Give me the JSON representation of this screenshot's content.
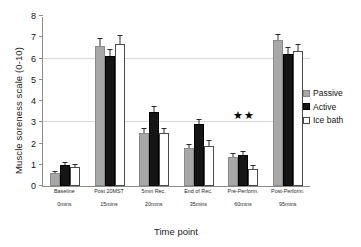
{
  "chart_data": {
    "type": "bar",
    "title": "",
    "xlabel": "Time point",
    "ylabel": "Muscle soreness scale (0-10)",
    "ylim": [
      0,
      8
    ],
    "yticks": [
      0,
      1,
      2,
      3,
      4,
      5,
      6,
      7,
      8
    ],
    "grid": "horizontal gridlines at 3 and 6",
    "legend_position": "right",
    "categories": [
      "Baseline",
      "Post 20MST",
      "5min Rec.",
      "End of Rec.",
      "Pre-Perform.",
      "Post-Perform."
    ],
    "category_sublabels": [
      "0mins",
      "15mins",
      "20mins",
      "35mins",
      "60mins",
      "95mins"
    ],
    "series": [
      {
        "name": "Passive",
        "color": "#a8a8a8",
        "values": [
          0.6,
          6.6,
          2.5,
          1.8,
          1.35,
          6.85
        ],
        "errors": [
          0.05,
          0.3,
          0.2,
          0.15,
          0.15,
          0.25
        ]
      },
      {
        "name": "Active",
        "color": "#151515",
        "values": [
          1.0,
          6.1,
          3.5,
          2.9,
          1.45,
          6.2
        ],
        "errors": [
          0.1,
          0.3,
          0.2,
          0.2,
          0.15,
          0.3
        ]
      },
      {
        "name": "Ice bath",
        "color": "#ffffff",
        "values": [
          0.9,
          6.7,
          2.5,
          1.9,
          0.8,
          6.35
        ],
        "errors": [
          0.1,
          0.35,
          0.2,
          0.2,
          0.15,
          0.3
        ]
      }
    ],
    "annotations": [
      {
        "text": "★★",
        "category": "Pre-Perform.",
        "y": 3.05
      }
    ]
  },
  "legend": {
    "items": [
      {
        "label": "Passive",
        "swatch": "passive-swatch"
      },
      {
        "label": "Active",
        "swatch": "active-swatch"
      },
      {
        "label": "Ice bath",
        "swatch": "ice-bath-swatch"
      }
    ]
  }
}
